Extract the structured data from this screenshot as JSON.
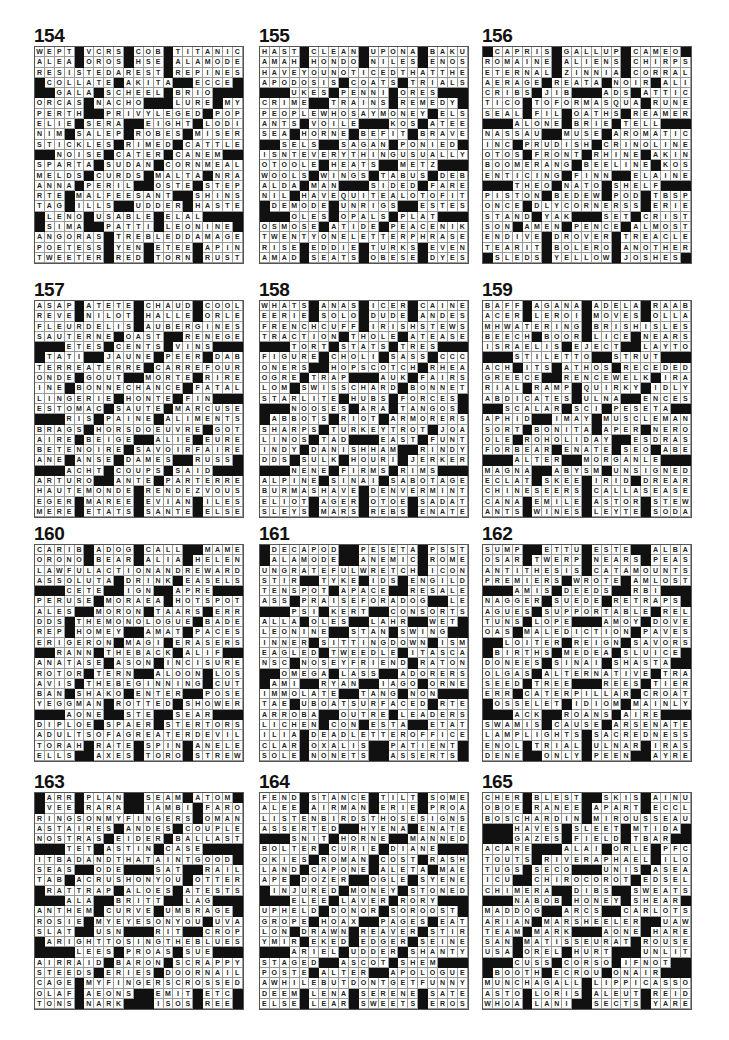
{
  "page": {
    "type": "crossword solutions page",
    "blank_char": "#"
  },
  "puzzles": [
    {
      "number": "154",
      "rows": [
        "WEPT#VCRS#COB#TITANIC",
        "ALEA#OROS#HSE#ALAMODE",
        "RESISTEDAREST#REPINES",
        "#COLLATE#AKITA##ECCE#",
        "##GALA#SCHEEL#BRIO###",
        "ORCAS#NACHO###LURE#MYS",
        "PERTH##PRIVYLEGED#POP",
        "ELIE#SERA##EIGHT#LODI",
        "NIM#SALEP#ROBES#MISER",
        "STICKLES#RIMED#CATTLE",
        "##NOISE#CATER#CANEM##",
        "SPARTA#SUDAN#CORNMEAL",
        "MELDS#CURDS#MALTA#NRA",
        "ANNA#PERIL##OSTE#STEP",
        "RTE#MALFEESANT##SHINS",
        "TAG#ILLS##UDDER#HASTE",
        "#LENO#USABLE#ELAL###",
        "#SIMA##PATTI#LEONINE#",
        "ANGORAS#TREBLEDDAMAGE",
        "POETESS#YEN#ETEE#APIN",
        "TWEETER#RED#TORN#RUST"
      ]
    },
    {
      "number": "155",
      "rows": [
        "HAST#CLEAN#UPONA#BAKU",
        "AMAH#HONDO#NILES#ENOS",
        "HAVEYOUNOTICEDTHATTHE",
        "APODOSIS#COATS#TRIALS",
        "###UKES#PENNI#ORES###",
        "CRIME##TRAINS#REMEDY#",
        "PEOPLEWHOSAYMONEY#ELS",
        "ANTS#VOILE###KOS#ATEE",
        "SEA#HORNE#BEFIT#BRAVE",
        "##SELS##SAGAN#PONIED#",
        "ISNTEVERYTHINGUSUALLY",
        "OTOOLE#HEATS##METZ###",
        "WOOLS#WINGS#TABUS#DEB",
        "ALDA#MAN###SIDED#FARE",
        "NIL#HAVEQUITEALOTOFIT",
        "#DEMODE#UNRIGS##ESTES",
        "###OLES#OPALS#PLAT###",
        "OSMOSE#ATIDE#PEACENIK",
        "TWENTYONELETTERPHRASE",
        "RISE#EDDIE#TURKS#EVEN",
        "AMAD#SEATS#OBESE#DYES"
      ]
    },
    {
      "number": "156",
      "rows": [
        "#CAPRIS#GALLUP#CAMEO#",
        "ROMAINE#ALIENS#CHIRPS",
        "ETERNAL#ZINNIA#CORRAL",
        "AERAGE#REATA#NOIR#ALI",
        "CRIBS#JIB###ADS#ATTIC",
        "TICO#TOFORMASQUA#RUNE",
        "SEAL#FIL#OATHS#REAMER",
        "###ALONE#BRIE#TELL###",
        "NASSAU##MUSE#AROMATIC",
        "INC#PRUDISH#CRINOLINE",
        "OTOS#FRONT#RHINE#AKIN",
        "BOOMERANG#BEELINE#KOS",
        "ENTICING#FINN##ELAINE",
        "###THEO#NATO#SHELF###",
        "PISTON#BEDEW#POD#TBSP",
        "ONCE#DLYCORNERSS#ERIE",
        "STAND#YAK###SET#CRIST",
        "SON#AMEN#PENCE#ALMOST",
        "ENDIVE#DROVER#TREACLE",
        "TEARIT#BOLERO#ANOTHER",
        "#SLEDS#YELLOW#JOSHES#"
      ]
    },
    {
      "number": "157",
      "rows": [
        "ASAP#ATETE#CHAUD#COOL",
        "REVE#NILOT#HALLE#ORLE",
        "FLEURDELIS#AUBERGINES",
        "SAUTERNE#OAST##RENEGE",
        "###ETES#CENTS#VINS###",
        "#TATI##JAUNE#PEER#DAB",
        "TERREATERRE#CARREFOUR",
        "ONDE#GOUT##MORTE#RIRE",
        "INE#BONNECHANCE#FATAL",
        "LINGERIE#HONTE#FIN###",
        "ESTOMAC#SAUTE#MARCUSE",
        "###RIS#PAINE#ALIMENTS",
        "BRAGS#HORSDOEUVRE#GOT",
        "AIRE#BEIGE##ALIE#EURE",
        "BETENOIRE#SAVOIRFAIRE",
        "ANE#ANSE#DAMES##RUSS#",
        "###ACHT#COUPS#SAID###",
        "ARTURO##ANTE#PARTERRE",
        "HAUTEMONDE#RENDEZVOUS",
        "EGER#MAREE#EVIAN#ILES",
        "MERE#ETATS#SANTE#ELSE"
      ]
    },
    {
      "number": "158",
      "rows": [
        "WHATS#ANAS#ICER#CAINE",
        "EERIE#SOLO#DUDE#ANDES",
        "FRENCHCUFF#IRISHSTEWS",
        "TRACTION#THOLE#ATEASE",
        "###TORT#STATS#TRES###",
        "FIGURE#CHOLI#SASS#CCC",
        "ONERS##HOPSCOTCH#RHEA",
        "OGRE#TRAP###AUK#FAIRS",
        "LOM#SWISSCHARD#BONNET",
        "STARLITE#HUBS#FORCES#",
        "###NOOSES#ARA#TANGOS#",
        "#ABBOTS#RIOT#ARMORERS",
        "SHARPS#TURKEYTROT#JOA",
        "LINOS#TAD###EAST#FUNT",
        "INDY#DANISHHAM##RINDY",
        "DDS#SULK#HOURI#JERKER",
        "###NENE#FIRMS#RIMS###",
        "ALPINE#SINAI#SABOTAGE",
        "BURMASHAVE#DENVERMINT",
        "ELIOT#AGER#OTOE#SADAT",
        "SLEYS#MARS#REBS#ENATE"
      ]
    },
    {
      "number": "159",
      "rows": [
        "BAFF#AGANA#ADELA#RAAB",
        "ACER#LEROI#MOVES#OLLA",
        "MHWATERING#BRISHISLES",
        "BEECH#BOOR#LICE#NEARS",
        "ISRAELIS#EJECT##LAYTO",
        "###STILETTO##STRUT###",
        "ACH#ITS#ATHOS#RECEDED",
        "GREECE##RENCEWELK#IRA",
        "RIAL#RAMP#QUIRKY#IDLY",
        "ABDICATES#ULNA##ENCES",
        "##SCALAR#SCI#PESETA##",
        "APHID##IMAY#MUSCLEMAN",
        "SORT#BONITA#APER#NERO",
        "OLE#ROHOLIDAY##ESDRAS",
        "FORBEAR#ENATE#SEO#ABE",
        "###ALTER##MORGANLE###",
        "MAGNA##ABYSM#UNSIGNED",
        "ECLAT#SKEE#IRID#DREAR",
        "CHINESEERS#CALLASEASE",
        "CANA#EMILE#ASTOR#STEW",
        "ANTS#WINES#LEYTE#SODA"
      ]
    },
    {
      "number": "160",
      "rows": [
        "CARIB#ADOG#CALL##MAME",
        "ORONO#BEAR#ALIA#HELEN",
        "LAWFULACTIONANDREWARD",
        "ASSOLUTA#DRINK#EASELS",
        "###CETE##IGN##APRE###",
        "PERUSE#MORAEA#HOTSPOT",
        "ALES##MORON#TAARS#ERR",
        "DDS#THEMONOLOGUE#BADE",
        "REP#HOMEY##AMAT#PACES",
        "ERIGERON#MAGI#ERASERS",
        "##RANN#THEBACK#ALIF##",
        "ANATASE#ASON#INCISURE",
        "ROTOR#TERN##ALOON#LOS",
        "AVIS#THEBEGINNING#CUT",
        "BAN#SHAKO#ENTER##POSE",
        "YEGGMAN#ROTTED#SHOWER",
        "###AONE##STE##SEAR###",
        "DIPLOE#SPAER#STERTORS",
        "ADULTSOFAGREATERDEVIL",
        "TORAH#RATE#SPIN#ANELE",
        "ELLS##AXES#TORO#STREW"
      ]
    },
    {
      "number": "161",
      "rows": [
        "#DECAPOD##PESETA#PSST",
        "#ALAMODE##ANEMIC#ROME",
        "UNGRATEFULWRETCH#ICON",
        "STIR##TYKE#IDS#ENGILD",
        "TENSPOT#APACE##RESALE",
        "ASS#PRAISEFORADOG##LER",
        "###PSI#KERT##CONSORTS",
        "ALLA#OLES##LAHR##WET#",
        "LEONINE##STAN#SWING##",
        "INNER#SITTINGDOWN#ISM",
        "EAGLED#TWEEDLE#ITASCA",
        "NSC#NOSEYFRIEND#RATON",
        "##OMEGA#LASS##ADORERS",
        "#AMI##RYAN##IAGO#ORNE",
        "IMMOLATE##TANG#NON###",
        "TAE#UBOATSURFACED#RTE",
        "ARROBA##OUTRE#LEADERS",
        "LICHEN#CON#ESTA##ETAT",
        "ILIA#DEADLETTEROFFICE",
        "CLAR#OXALIS##PATIENT#",
        "SOLE#NONETS##ASSERTS#"
      ]
    },
    {
      "number": "162",
      "rows": [
        "SUMP##ETTU#ESTE##ALBA",
        "OSAR#TWERP#NEARS#PEAS",
        "ANTITHESIS#CATAMOUNTS",
        "PREMIERS#WROTE#AMLOST",
        "###AMIS#DEEDS##RBI###",
        "NAGGER#SUEDE#RETRAPS#",
        "AGUES#SUPPORTABLE#REL",
        "TUNS#LOPE###AMOY#DOVE",
        "OAS#MALEDICTION#PAVES",
        "##LOITER#REIGN#SAVORS",
        "#BIRTHS#MEDEA#SLUICE#",
        "DONEES#SINAI#SHASTA##",
        "OLGAS#ALTERNATIVE#TRA",
        "SEED#TREE###REES#TIER",
        "ERR#CATERPILLAR#CROAT",
        "#OSSELET#IDIOM#MAINLY",
        "###ACK##ROANS#AIRE###",
        "SWAMIS#CAUSE#ARSENATE",
        "LAMPLIGHTS#SACREDNESS",
        "ENOL#TRIAL#ULNAR#IRAS",
        "DENE##ONLY#PEEN##AYRE"
      ]
    },
    {
      "number": "163",
      "rows": [
        "#ARR#PLAN##SEAM#ATOM",
        "#VEE#RARA##IAMBI#FARO",
        "RINGSONMYFINGERS#OMAN",
        "ASTAIRES#ANDES#COUPLE",
        "NOSTRAS#EIDER#BALLAST",
        "###TET#ASTIN#CASE####",
        "ITBADANDTHATAINTGOOD#",
        "SEAS##ODE###SAT##RAIL",
        "TAB#ACRUSHONYOU#OTTER",
        "#RATTRAP#ALOES#ATESTS",
        "###ALA##BRITT##LAG###",
        "ANTHEM#CURVE#UMBRAGE#",
        "ROSIE#MYEYESONYOU#UVA",
        "SLAT##USN###RIT##CROP",
        "#ARIGHTTOSINGTHEBLUES",
        "####LEES#PROAS#SUE###",
        "AIRRAID#BARON#SCRAPPY",
        "STEEDS#ERIES#DOORNAIL",
        "CAGE#MYFINGERSCROSSED",
        "OLAF#AEONS##EMIT#ETC#",
        "TONS#NARK###ISOS#REE#"
      ]
    },
    {
      "number": "164",
      "rows": [
        "FEND#STANCE#TILT#SOME",
        "ALEE#AIRMAN#ERIE#PROA",
        "LISTENBIRDSTHOSESIGNS",
        "ASSERTED##HYENA#ENATE",
        "###SNIT#HORNE##MANNED",
        "BOLTER#CURIE#DIANE###",
        "OKIES#ROMAN#COST#RASH",
        "LAND#CAPONE#ALETA#MAE",
        "APE#DOZER##OGLE#SYENE",
        "#INJURED#MONEY#STONED",
        "###ELEE#LAVER#RORY###",
        "UPHELD#DONOR#SOROOST#",
        "GROPE#HOAX##PAGES#EAT",
        "LON#DRAWN#REAVER#STIR",
        "YMIR#EKED#EDGER#SEINE",
        "###ARIEL#UDDER#SHANTY",
        "STAGED##ASCOT#SHEM###",
        "POSTE#ALTER##APOLOGUE",
        "AWHILEBUTDONTGETFUNNY",
        "DEEM#LENA#SERENE#SATE",
        "ELSE#LEAR#SWEETS#EROS"
      ]
    },
    {
      "number": "165",
      "rows": [
        "CHER#BLEST##SKIS#AINU",
        "OBOE#RANEE#APART#ECCL",
        "BOSCHARDIN#MIROUSSEAU",
        "###HAVES#SLEET#MTIDA#",
        "###GAZES#FIELD#TBAR###",
        "ACARE###ALAI#ORLE#PFC",
        "TOUTS#RIVERAPHAEL#ILO",
        "TUGS#SECO###UNIS#ASEA",
        "ICU##CHIROCOROT#EDSEL",
        "CHIMERA##DIBS##SWEATS",
        "###NABOB#HONEY#SHEAR#",
        "MADDOG##ARCS##CARLOTS",
        "ARIAN#MARSHEELER##UAW",
        "TEAM#MARK###AONE#HARE",
        "SAN#MATISSEURAT#ROUSE",
        "USA#OREL#HURT###UNLIT",
        "###CUSS#CORSO#IFNOT##",
        "#BOOTH#ECROU#ONAIR###",
        "MUNCHAGALL#LIPPICASSO",
        "ASTO#LORIS#ALEUT#REID",
        "WHOA#LANI##SECTS#YARE"
      ]
    }
  ]
}
